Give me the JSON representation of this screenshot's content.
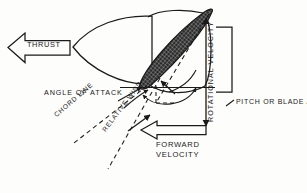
{
  "diagram": {
    "background_color": "#fdfdfc",
    "ink_color": "#1a1a1a",
    "labels": {
      "thrust": "THRUST",
      "angle_of_attack": "ANGLE OF ATTACK",
      "chord_line": "CHORD LINE",
      "relative_wind": "RELATIVE WIND",
      "rotational_velocity": "ROTATIONAL VELOCITY",
      "pitch_or": "PITCH OR",
      "blade_angle": "BLADE ANGLE",
      "forward_line1": "FORWARD",
      "forward_line2": "VELOCITY"
    },
    "elements": [
      "thrust-block-arrow",
      "spinner-nose-cone",
      "propeller-blade-airfoil",
      "chord-line-dashed",
      "relative-wind-dashed",
      "plane-of-rotation-line",
      "angle-of-attack-arc",
      "pitch-angle-arc",
      "rotational-velocity-arrow",
      "forward-velocity-block-arrow",
      "pitch-bracket",
      "pitch-leader-line"
    ]
  }
}
